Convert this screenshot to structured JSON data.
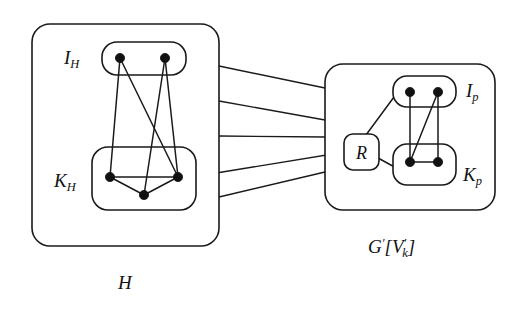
{
  "figure": {
    "background_color": "#ffffff",
    "stroke_color": "#1a1a1a",
    "vertex_color": "#111111"
  },
  "left_structure": {
    "caption": "H",
    "groups": [
      {
        "key": "I_H",
        "label_main": "I",
        "label_sub": "H",
        "vertex_count": 2
      },
      {
        "key": "K_H",
        "label_main": "K",
        "label_sub": "H",
        "vertex_count": 3
      }
    ]
  },
  "right_structure": {
    "caption_main": "G",
    "caption_prime": "′",
    "caption_bracket_open": "[",
    "caption_v": "V",
    "caption_v_prime": "′",
    "caption_v_sub": "k",
    "caption_bracket_close": "]",
    "caption_plain": "G′[V′k]",
    "node_r_label": "R",
    "groups": [
      {
        "key": "I_p",
        "label_main": "I",
        "label_sub": "p",
        "vertex_count": 2
      },
      {
        "key": "K_p",
        "label_main": "K",
        "label_sub": "p",
        "vertex_count": 2
      }
    ]
  },
  "connections": {
    "cross_edge_count": 5,
    "description": "edges between H and G'[V'_k]"
  }
}
